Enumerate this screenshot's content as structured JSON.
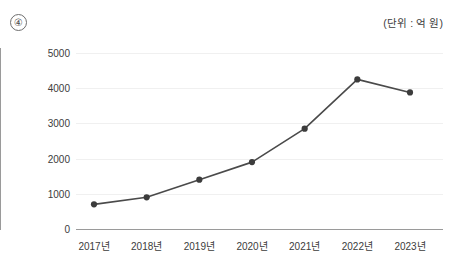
{
  "question_marker": "④",
  "unit_note": "(단위 : 억 원)",
  "chart_data": {
    "type": "line",
    "title": "",
    "subtitle": "",
    "xlabel": "",
    "ylabel": "",
    "unit": "억 원",
    "categories": [
      "2017년",
      "2018년",
      "2019년",
      "2020년",
      "2021년",
      "2022년",
      "2023년"
    ],
    "values": [
      700,
      900,
      1400,
      1900,
      2850,
      4250,
      3880
    ],
    "series": [
      {
        "name": "",
        "values": [
          700,
          900,
          1400,
          1900,
          2850,
          4250,
          3880
        ]
      }
    ],
    "ylim": [
      0,
      5000
    ],
    "yticks": [
      0,
      1000,
      2000,
      3000,
      4000,
      5000
    ],
    "ytick_labels": [
      "0",
      "1000",
      "2000",
      "3000",
      "4000",
      "5000"
    ],
    "grid": true,
    "legend": "none",
    "marker": "circle",
    "line_color": "#4a4a4a",
    "marker_color": "#3c3c3c",
    "grid_color": "#f0f0f0",
    "axis_color": "#9a9a9a"
  }
}
